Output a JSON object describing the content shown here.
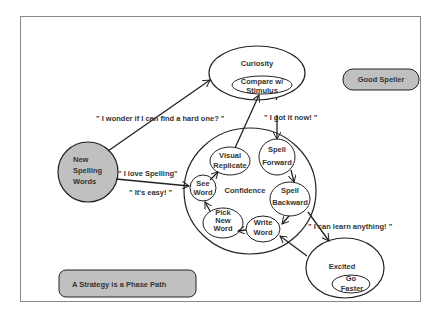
{
  "diagram": {
    "title_box": "A Strategy is a Phase Path",
    "goal_box": "Good Speller",
    "nodes": {
      "new_words": [
        "New",
        "Spelling",
        "Words"
      ],
      "curiosity": "Curiosity",
      "compare": [
        "Compare w/",
        "Stimulus"
      ],
      "confidence": "Confidence",
      "visual": [
        "Visual",
        "Replicate"
      ],
      "spell_forward": [
        "Spell",
        "Forward"
      ],
      "spell_backward": [
        "Spell",
        "Backward"
      ],
      "write_word": [
        "Write",
        "Word"
      ],
      "pick_new": [
        "Pick",
        "New",
        "Word"
      ],
      "see_word": [
        "See",
        "Word"
      ],
      "excited": "Excited",
      "go_faster": [
        "Go",
        "Faster"
      ]
    },
    "quotes": {
      "wonder": "\" I wonder if I can find a hard one? \"",
      "got_it": "\" I got it now! \"",
      "love": "\" I love Spelling\"",
      "easy": "\" It's easy! \"",
      "learn": "\" I can learn anything! \""
    },
    "colors": {
      "gray_fill": "#c0c0c0",
      "stroke": "#222222",
      "frame": "#888888"
    }
  }
}
